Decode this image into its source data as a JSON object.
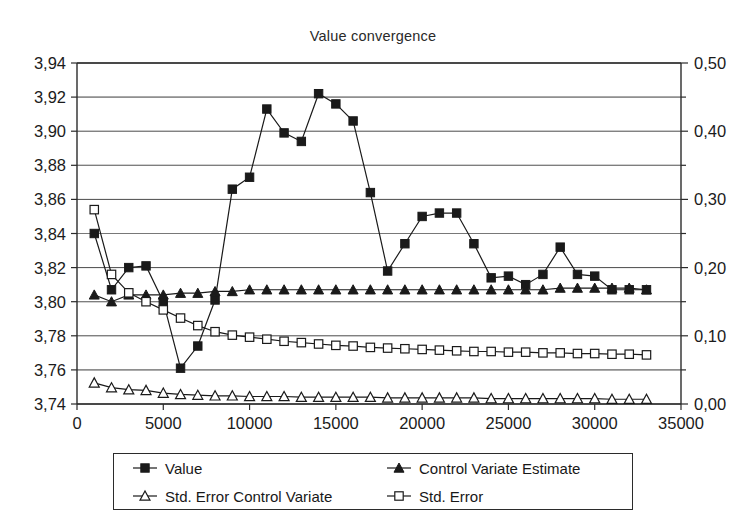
{
  "chart_data": {
    "type": "line",
    "title": "Value convergence",
    "xlabel": "",
    "ylabel": "",
    "grid": true,
    "legend_position": "bottom",
    "xlim": [
      0,
      35000
    ],
    "xticks": [
      0,
      5000,
      10000,
      15000,
      20000,
      25000,
      30000,
      35000
    ],
    "xtick_labels": [
      "0",
      "5000",
      "10000",
      "15000",
      "20000",
      "25000",
      "30000",
      "35000"
    ],
    "y_left_lim": [
      3.74,
      3.94
    ],
    "y_left_ticks": [
      3.74,
      3.76,
      3.78,
      3.8,
      3.82,
      3.84,
      3.86,
      3.88,
      3.9,
      3.92,
      3.94
    ],
    "y_left_tick_labels": [
      "3,74",
      "3,76",
      "3,78",
      "3,80",
      "3,82",
      "3,84",
      "3,86",
      "3,88",
      "3,90",
      "3,92",
      "3,94"
    ],
    "y_right_lim": [
      0.0,
      0.5
    ],
    "y_right_ticks": [
      0.0,
      0.1,
      0.2,
      0.3,
      0.4,
      0.5
    ],
    "y_right_tick_labels": [
      "0,00",
      "0,10",
      "0,20",
      "0,30",
      "0,40",
      "0,50"
    ],
    "y_right_minor_ticks": [
      0.05,
      0.15,
      0.25,
      0.35,
      0.45
    ],
    "x": [
      1000,
      2000,
      3000,
      4000,
      5000,
      6000,
      7000,
      8000,
      9000,
      10000,
      11000,
      12000,
      13000,
      14000,
      15000,
      16000,
      17000,
      18000,
      19000,
      20000,
      21000,
      22000,
      23000,
      24000,
      25000,
      26000,
      27000,
      28000,
      29000,
      30000,
      31000,
      32000,
      33000
    ],
    "series": [
      {
        "name": "Value",
        "axis": "left",
        "marker": "filled-square",
        "values": [
          3.84,
          3.807,
          3.82,
          3.821,
          3.8,
          3.761,
          3.774,
          3.801,
          3.866,
          3.873,
          3.913,
          3.899,
          3.894,
          3.922,
          3.916,
          3.906,
          3.864,
          3.818,
          3.834,
          3.85,
          3.852,
          3.852,
          3.834,
          3.814,
          3.815,
          3.81,
          3.816,
          3.832,
          3.816,
          3.815,
          3.807,
          3.807,
          3.807
        ]
      },
      {
        "name": "Control Variate Estimate",
        "axis": "left",
        "marker": "filled-triangle",
        "values": [
          3.804,
          3.8,
          3.804,
          3.804,
          3.804,
          3.805,
          3.805,
          3.806,
          3.806,
          3.807,
          3.807,
          3.807,
          3.807,
          3.807,
          3.807,
          3.807,
          3.807,
          3.807,
          3.807,
          3.807,
          3.807,
          3.807,
          3.807,
          3.807,
          3.807,
          3.807,
          3.807,
          3.808,
          3.808,
          3.808,
          3.808,
          3.808,
          3.807
        ]
      },
      {
        "name": "Std. Error",
        "axis": "right",
        "marker": "open-square",
        "values": [
          0.285,
          0.19,
          0.163,
          0.15,
          0.138,
          0.126,
          0.115,
          0.106,
          0.101,
          0.098,
          0.095,
          0.092,
          0.09,
          0.088,
          0.086,
          0.085,
          0.083,
          0.082,
          0.081,
          0.08,
          0.079,
          0.078,
          0.077,
          0.077,
          0.076,
          0.076,
          0.075,
          0.075,
          0.074,
          0.074,
          0.073,
          0.073,
          0.072
        ]
      },
      {
        "name": "Std. Error Control Variate",
        "axis": "right",
        "marker": "open-triangle",
        "values": [
          0.031,
          0.024,
          0.021,
          0.02,
          0.016,
          0.014,
          0.013,
          0.012,
          0.012,
          0.011,
          0.011,
          0.011,
          0.01,
          0.01,
          0.01,
          0.01,
          0.01,
          0.009,
          0.009,
          0.009,
          0.009,
          0.009,
          0.009,
          0.008,
          0.008,
          0.008,
          0.008,
          0.008,
          0.008,
          0.008,
          0.007,
          0.007,
          0.007
        ]
      }
    ]
  },
  "legend": {
    "entries": [
      {
        "label": "Value",
        "marker": "filled-square"
      },
      {
        "label": "Control Variate Estimate",
        "marker": "filled-triangle"
      },
      {
        "label": "Std. Error Control Variate",
        "marker": "open-triangle"
      },
      {
        "label": "Std. Error",
        "marker": "open-square"
      }
    ]
  },
  "colors": {
    "ink": "#1a1a1a",
    "grid": "#4a4a4a",
    "background": "#ffffff"
  }
}
